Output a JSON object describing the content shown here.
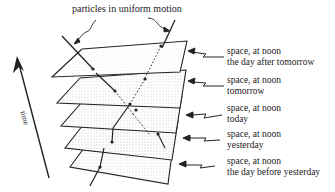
{
  "diagram": {
    "caption": "particles in uniform motion",
    "axis": {
      "label": "time",
      "direction": "up"
    },
    "planes": [
      {
        "line1": "space, at noon",
        "line2": "the day after tomorrow"
      },
      {
        "line1": "space, at noon",
        "line2": "tomorrow"
      },
      {
        "line1": "space, at noon",
        "line2": "today"
      },
      {
        "line1": "space, at noon",
        "line2": "yesterday"
      },
      {
        "line1": "space, at noon",
        "line2": "the day before yesterday"
      }
    ],
    "colors": {
      "ink": "#222222",
      "shade": "#9a9a9a",
      "background": "#ffffff"
    }
  }
}
